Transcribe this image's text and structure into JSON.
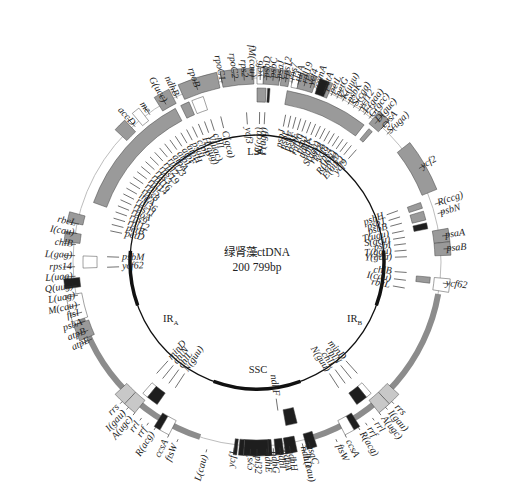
{
  "figure": {
    "title_line1": "绿肾藻ctDNA",
    "title_line2": "200 799bp",
    "regions": {
      "lsc": "LSC",
      "ssc": "SSC",
      "ira_main": "IR",
      "ira_sub": "A",
      "irb_main": "IR",
      "irb_sub": "B"
    },
    "colors": {
      "gray": "#9a9a9a",
      "dark": "#1e1e1e",
      "white": "#ffffff",
      "light": "#c8c8c8",
      "ring": "#8c8c8c",
      "inner": "#111111"
    },
    "outer_labels": [
      {
        "t": "accD",
        "a": -42,
        "r": 185
      },
      {
        "t": "me",
        "a": -36,
        "r": 185
      },
      {
        "t": "G(ucc)",
        "a": -30,
        "r": 185
      },
      {
        "t": "ndhB",
        "a": -26,
        "r": 185
      },
      {
        "t": "rpoB",
        "a": -19,
        "r": 185
      },
      {
        "t": "rpoC1",
        "a": -11,
        "r": 185
      },
      {
        "t": "rpoC2",
        "a": -7,
        "r": 185
      },
      {
        "t": "rps2",
        "a": -4,
        "r": 185
      },
      {
        "t": "fM(cau)",
        "a": -1.5,
        "r": 185
      },
      {
        "t": "ycf6",
        "a": 1,
        "r": 185
      },
      {
        "t": "psbD",
        "a": 3,
        "r": 185
      },
      {
        "t": "psbC",
        "a": 5,
        "r": 185
      },
      {
        "t": "psaJ",
        "a": 7,
        "r": 185
      },
      {
        "t": "rps12",
        "a": 9,
        "r": 185
      },
      {
        "t": "rps7",
        "a": 11,
        "r": 185
      },
      {
        "t": "tufA",
        "a": 13,
        "r": 185
      },
      {
        "t": "rpl19",
        "a": 15,
        "r": 185
      },
      {
        "t": "ycf4",
        "a": 17,
        "r": 185
      },
      {
        "t": "cemA",
        "a": 19,
        "r": 185
      },
      {
        "t": "petA",
        "a": 21.5,
        "r": 185
      },
      {
        "t": "petL",
        "a": 24,
        "r": 185
      },
      {
        "t": "petG",
        "a": 26,
        "r": 185
      },
      {
        "t": "K(uuu)",
        "a": 28,
        "r": 185
      },
      {
        "t": "psbK",
        "a": 30,
        "r": 185
      },
      {
        "t": "S(cga)",
        "a": 32,
        "r": 185
      },
      {
        "t": "ycf12",
        "a": 34,
        "r": 185
      },
      {
        "t": "F(gaa)",
        "a": 36,
        "r": 185
      },
      {
        "t": "G(gcc)",
        "a": 38,
        "r": 185
      },
      {
        "t": "D(guc)",
        "a": 40.5,
        "r": 185
      },
      {
        "t": "cysA",
        "a": 43,
        "r": 185
      },
      {
        "t": "S(uga)",
        "a": 45.5,
        "r": 185
      },
      {
        "t": "ycf2",
        "a": 60,
        "r": 190
      },
      {
        "t": "R(ccg)",
        "a": 72,
        "r": 190
      },
      {
        "t": "psbN",
        "a": 75,
        "r": 190
      },
      {
        "t": "psaA",
        "a": 82,
        "r": 190
      },
      {
        "t": "psaB",
        "a": 86,
        "r": 190
      },
      {
        "t": "ycf62",
        "a": 96.5,
        "r": 190
      },
      {
        "t": "atpE",
        "a": -115,
        "r": 185
      },
      {
        "t": "atpB",
        "a": -112,
        "r": 185
      },
      {
        "t": "psbA",
        "a": -109,
        "r": 185
      },
      {
        "t": "ftsI",
        "a": -106,
        "r": 185
      },
      {
        "t": "M(cau)",
        "a": -103.5,
        "r": 185
      },
      {
        "t": "L(uag)",
        "a": -100.5,
        "r": 185
      },
      {
        "t": "Q(uug)",
        "a": -97.5,
        "r": 185
      },
      {
        "t": "L(uaa)",
        "a": -94.5,
        "r": 185
      },
      {
        "t": "rps14",
        "a": -91.5,
        "r": 185
      },
      {
        "t": "L(gag)",
        "a": -88,
        "r": 185
      },
      {
        "t": "chlB",
        "a": -84.5,
        "r": 185
      },
      {
        "t": "I(cau)",
        "a": -81,
        "r": 185
      },
      {
        "t": "rbcL",
        "a": -78,
        "r": 185
      }
    ],
    "inner_labels_left": [
      {
        "t": "ycf3",
        "a": -4,
        "r": 135
      },
      {
        "t": "C(gca)",
        "a": -14,
        "r": 135
      },
      {
        "t": "chlI",
        "a": -18,
        "r": 135
      },
      {
        "t": "V(uac)",
        "a": -20.5,
        "r": 135
      },
      {
        "t": "H(gug)",
        "a": -23,
        "r": 135
      },
      {
        "t": "clpP",
        "a": -25.5,
        "r": 135
      },
      {
        "t": "psaI",
        "a": -28,
        "r": 135
      },
      {
        "t": "atpH",
        "a": -30.5,
        "r": 135
      },
      {
        "t": "atpF",
        "a": -33,
        "r": 135
      },
      {
        "t": "atpI",
        "a": -35.5,
        "r": 135
      },
      {
        "t": "atpA",
        "a": -38,
        "r": 135
      },
      {
        "t": "rpl23",
        "a": -40.5,
        "r": 135
      },
      {
        "t": "rpl2",
        "a": -43,
        "r": 135
      },
      {
        "t": "rps19",
        "a": -45.5,
        "r": 135
      },
      {
        "t": "rps3",
        "a": -48,
        "r": 135
      },
      {
        "t": "rpl16",
        "a": -50.5,
        "r": 135
      },
      {
        "t": "rpl14",
        "a": -53,
        "r": 135
      },
      {
        "t": "rpl5",
        "a": -55.5,
        "r": 135
      },
      {
        "t": "rps8",
        "a": -58,
        "r": 135
      },
      {
        "t": "infA",
        "a": -60.5,
        "r": 135
      },
      {
        "t": "rpl36",
        "a": -63,
        "r": 135
      },
      {
        "t": "rps11",
        "a": -65.5,
        "r": 135
      },
      {
        "t": "rpoA",
        "a": -68,
        "r": 135
      },
      {
        "t": "rps9",
        "a": -70.5,
        "r": 135
      },
      {
        "t": "rpl12",
        "a": -73,
        "r": 135
      },
      {
        "t": "petB",
        "a": -75.5,
        "r": 135
      },
      {
        "t": "petD",
        "a": -78,
        "r": 135
      },
      {
        "t": "psbM",
        "a": -88,
        "r": 135
      },
      {
        "t": "ycf62",
        "a": -92,
        "r": 135
      }
    ],
    "inner_labels_right": [
      {
        "t": "W(cca)",
        "a": 1,
        "r": 135
      },
      {
        "t": "P(ugg)",
        "a": 3,
        "r": 135
      },
      {
        "t": "psbJ",
        "a": 11,
        "r": 135
      },
      {
        "t": "psbL",
        "a": 13,
        "r": 135
      },
      {
        "t": "psbF",
        "a": 15,
        "r": 135
      },
      {
        "t": "psbE",
        "a": 17,
        "r": 135
      },
      {
        "t": "rpl20",
        "a": 19,
        "r": 135
      },
      {
        "t": "psaJ",
        "a": 21,
        "r": 135
      },
      {
        "t": "ndhK",
        "a": 23,
        "r": 135
      },
      {
        "t": "ndhC",
        "a": 25,
        "r": 135
      },
      {
        "t": "S(gga)",
        "a": 27,
        "r": 135
      },
      {
        "t": "rpl18",
        "a": 29,
        "r": 135
      },
      {
        "t": "ycf8",
        "a": 31,
        "r": 135
      },
      {
        "t": "rps4",
        "a": 33,
        "r": 135
      },
      {
        "t": "R(ucg)",
        "a": 35,
        "r": 135
      },
      {
        "t": "rpl20",
        "a": 37,
        "r": 135
      },
      {
        "t": "E(uuc)",
        "a": 39,
        "r": 135
      },
      {
        "t": "ycf9",
        "a": 41.5,
        "r": 135
      },
      {
        "t": "psbH",
        "a": 70,
        "r": 135
      },
      {
        "t": "psbT",
        "a": 72.5,
        "r": 135
      },
      {
        "t": "psbB",
        "a": 75,
        "r": 135
      },
      {
        "t": "T(ugu)",
        "a": 78,
        "r": 135
      },
      {
        "t": "S(gcu)",
        "a": 80.5,
        "r": 135
      },
      {
        "t": "psbI",
        "a": 83,
        "r": 135
      },
      {
        "t": "T(ggu)",
        "a": 85.5,
        "r": 135
      },
      {
        "t": "Y(gua)",
        "a": 88,
        "r": 135
      },
      {
        "t": "chlB",
        "a": 94,
        "r": 135
      },
      {
        "t": "I(cau)",
        "a": 97,
        "r": 135
      },
      {
        "t": "rbcL",
        "a": 100,
        "r": 135
      }
    ],
    "lower_left_labels": [
      {
        "t": "rrs",
        "a": -136,
        "r": 200
      },
      {
        "t": "I(gau)",
        "a": -138.5,
        "r": 200
      },
      {
        "t": "A(ugc)",
        "a": -141,
        "r": 200
      },
      {
        "t": "rrl",
        "a": -143.5,
        "r": 200
      },
      {
        "t": "rrf",
        "a": -146,
        "r": 200
      },
      {
        "t": "R(acg)",
        "a": -148.5,
        "r": 200
      },
      {
        "t": "ccsA",
        "a": -153,
        "r": 200
      },
      {
        "t": "ftsW",
        "a": -156,
        "r": 200
      },
      {
        "t": "minD",
        "a": -138,
        "r": 130
      },
      {
        "t": "chlN",
        "a": -141,
        "r": 130
      },
      {
        "t": "chlL",
        "a": -144,
        "r": 130
      },
      {
        "t": "N(guu)",
        "a": -147,
        "r": 130
      },
      {
        "t": "L(cau)",
        "a": -165,
        "r": 200
      }
    ],
    "lower_right_labels": [
      {
        "t": "rrs",
        "a": 136,
        "r": 200
      },
      {
        "t": "I(gau)",
        "a": 138.5,
        "r": 200
      },
      {
        "t": "A(ugc)",
        "a": 141,
        "r": 200
      },
      {
        "t": "rrl",
        "a": 143.5,
        "r": 200
      },
      {
        "t": "rrf",
        "a": 146,
        "r": 200
      },
      {
        "t": "R(acg)",
        "a": 148.5,
        "r": 200
      },
      {
        "t": "ccsA",
        "a": 153,
        "r": 200
      },
      {
        "t": "ftsW",
        "a": 156,
        "r": 200
      },
      {
        "t": "minD",
        "a": 138,
        "r": 130
      },
      {
        "t": "chlN",
        "a": 141,
        "r": 130
      },
      {
        "t": "chlL",
        "a": 144,
        "r": 130
      },
      {
        "t": "N(guu)",
        "a": 147,
        "r": 130
      },
      {
        "t": "L(cau)",
        "a": 166,
        "r": 200
      }
    ],
    "bottom_labels": [
      {
        "t": "ycf1",
        "a": -173,
        "r": 190
      },
      {
        "t": "cysT",
        "a": -178,
        "r": 190
      },
      {
        "t": "rpl32",
        "a": -180,
        "r": 190
      },
      {
        "t": "ndhE",
        "a": 177,
        "r": 190
      },
      {
        "t": "ndhG",
        "a": 175,
        "r": 190
      },
      {
        "t": "ndhI",
        "a": 173,
        "r": 190
      },
      {
        "t": "ndhA",
        "a": 171.5,
        "r": 190
      },
      {
        "t": "ndhH",
        "a": 170,
        "r": 190
      },
      {
        "t": "ndhF",
        "a": -188,
        "r": 135
      },
      {
        "t": "ndhD",
        "a": 166,
        "r": 190
      },
      {
        "t": "psaC",
        "a": 164,
        "r": 190
      }
    ],
    "segments": [
      {
        "s": -47,
        "e": -43,
        "c": "gray",
        "lane": "outer"
      },
      {
        "s": -40,
        "e": -37.5,
        "c": "white",
        "lane": "outer"
      },
      {
        "s": -32,
        "e": -27,
        "c": "gray",
        "lane": "outer"
      },
      {
        "s": -24,
        "e": -12,
        "c": "gray",
        "lane": "outer"
      },
      {
        "s": -11,
        "e": -1,
        "c": "gray",
        "lane": "outer"
      },
      {
        "s": 0,
        "e": 2,
        "c": "white",
        "lane": "outer"
      },
      {
        "s": 2,
        "e": 7,
        "c": "gray",
        "lane": "outer"
      },
      {
        "s": 7.5,
        "e": 10,
        "c": "gray",
        "lane": "outer"
      },
      {
        "s": 11,
        "e": 13,
        "c": "white",
        "lane": "outer"
      },
      {
        "s": 13,
        "e": 18,
        "c": "gray",
        "lane": "outer"
      },
      {
        "s": 19,
        "e": 22,
        "c": "dark",
        "lane": "outer"
      },
      {
        "s": 22,
        "e": 23,
        "c": "gray",
        "lane": "outer"
      },
      {
        "s": 39,
        "e": 43,
        "c": "gray",
        "lane": "outer"
      },
      {
        "s": 52,
        "e": 68,
        "c": "gray",
        "lane": "outer"
      },
      {
        "s": 80,
        "e": 84,
        "c": "gray",
        "lane": "outer"
      },
      {
        "s": 84,
        "e": 88,
        "c": "gray",
        "lane": "outer"
      },
      {
        "s": 95,
        "e": 99,
        "c": "white",
        "lane": "outer"
      },
      {
        "s": -78,
        "e": -75,
        "c": "gray",
        "lane": "outer"
      },
      {
        "s": -84,
        "e": -81,
        "c": "gray",
        "lane": "outer"
      },
      {
        "s": -98,
        "e": -95,
        "c": "dark",
        "lane": "outer"
      },
      {
        "s": -108,
        "e": -100,
        "c": "white",
        "lane": "outer"
      },
      {
        "s": -114,
        "e": -109,
        "c": "gray",
        "lane": "outer"
      },
      {
        "s": -22,
        "e": -18,
        "c": "white",
        "lane": "inner"
      },
      {
        "s": -26,
        "e": -23,
        "c": "gray",
        "lane": "inner"
      },
      {
        "s": -70,
        "e": -28,
        "c": "gray",
        "lane": "inner"
      },
      {
        "s": -92,
        "e": -88,
        "c": "white",
        "lane": "inner"
      },
      {
        "s": 0,
        "e": 3,
        "c": "gray",
        "lane": "inner"
      },
      {
        "s": 3.5,
        "e": 4.3,
        "c": "dark",
        "lane": "inner"
      },
      {
        "s": 10,
        "e": 38,
        "c": "gray",
        "lane": "inner"
      },
      {
        "s": 40,
        "e": 41.5,
        "c": "gray",
        "lane": "inner"
      },
      {
        "s": 70,
        "e": 72,
        "c": "gray",
        "lane": "inner"
      },
      {
        "s": 73,
        "e": 76,
        "c": "gray",
        "lane": "inner"
      },
      {
        "s": 77,
        "e": 79,
        "c": "dark",
        "lane": "inner"
      },
      {
        "s": 95,
        "e": 97,
        "c": "gray",
        "lane": "inner"
      },
      {
        "s": -137,
        "e": -133,
        "c": "light",
        "lane": "outer"
      },
      {
        "s": -141,
        "e": -137,
        "c": "light",
        "lane": "outer"
      },
      {
        "s": -150,
        "e": -148,
        "c": "dark",
        "lane": "outer"
      },
      {
        "s": -153,
        "e": -150,
        "c": "white",
        "lane": "outer"
      },
      {
        "s": -141,
        "e": -139,
        "c": "white",
        "lane": "inner"
      },
      {
        "s": -145,
        "e": -141,
        "c": "dark",
        "lane": "inner"
      },
      {
        "s": 133,
        "e": 137,
        "c": "light",
        "lane": "outer"
      },
      {
        "s": 137,
        "e": 141,
        "c": "light",
        "lane": "outer"
      },
      {
        "s": 148,
        "e": 150,
        "c": "dark",
        "lane": "outer"
      },
      {
        "s": 150,
        "e": 153,
        "c": "white",
        "lane": "outer"
      },
      {
        "s": 139,
        "e": 141,
        "c": "white",
        "lane": "inner"
      },
      {
        "s": 141,
        "e": 145,
        "c": "dark",
        "lane": "inner"
      },
      {
        "s": -184,
        "e": -176,
        "c": "dark",
        "lane": "outer"
      },
      {
        "s": -176,
        "e": -174.5,
        "c": "dark",
        "lane": "outer"
      },
      {
        "s": -174,
        "e": -173,
        "c": "dark",
        "lane": "outer"
      },
      {
        "s": 175.5,
        "e": 176.5,
        "c": "dark",
        "lane": "outer"
      },
      {
        "s": 172,
        "e": 174.5,
        "c": "dark",
        "lane": "outer"
      },
      {
        "s": 168,
        "e": 171.5,
        "c": "dark",
        "lane": "outer"
      },
      {
        "s": 166,
        "e": 170,
        "c": "dark",
        "lane": "inner2"
      },
      {
        "s": 162,
        "e": 165,
        "c": "dark",
        "lane": "outer"
      }
    ],
    "ir_arcs": [
      {
        "s": 100,
        "e": 162,
        "lane": "ring"
      },
      {
        "s": -162,
        "e": -100,
        "lane": "ring"
      }
    ],
    "inner_thick_arcs": [
      {
        "s": -110,
        "e": -85
      },
      {
        "s": 85,
        "e": 110
      },
      {
        "s": 160,
        "e": 200
      }
    ]
  }
}
